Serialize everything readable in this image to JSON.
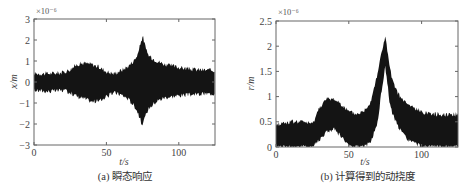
{
  "chart_data": [
    {
      "type": "area",
      "title": "",
      "caption": "(a) 瞬态响应",
      "xlabel": "t/s",
      "ylabel": "x/m",
      "y_multiplier": "×10⁻⁶",
      "xlim": [
        0,
        125
      ],
      "ylim": [
        -3,
        3
      ],
      "xticks": [
        0,
        50,
        100
      ],
      "yticks": [
        -3,
        -2,
        -1,
        0,
        1,
        2,
        3
      ],
      "grid": false,
      "description": "Dense oscillating transient response envelope (symmetric about zero)",
      "series": [
        {
          "name": "upper envelope",
          "x": [
            0,
            10,
            20,
            25,
            30,
            35,
            40,
            45,
            50,
            55,
            60,
            65,
            70,
            72,
            75,
            78,
            80,
            85,
            90,
            100,
            110,
            125
          ],
          "values": [
            0.4,
            0.4,
            0.45,
            0.6,
            0.85,
            0.9,
            0.85,
            0.7,
            0.5,
            0.4,
            0.55,
            0.75,
            1.1,
            1.4,
            2.2,
            1.4,
            1.2,
            1.0,
            0.85,
            0.7,
            0.6,
            0.55
          ]
        },
        {
          "name": "lower envelope",
          "x": [
            0,
            10,
            20,
            25,
            30,
            35,
            40,
            45,
            50,
            55,
            60,
            65,
            70,
            72,
            75,
            78,
            80,
            85,
            90,
            100,
            110,
            125
          ],
          "values": [
            -0.4,
            -0.45,
            -0.4,
            -0.5,
            -0.7,
            -0.8,
            -0.95,
            -0.9,
            -0.7,
            -0.5,
            -0.6,
            -0.8,
            -1.2,
            -1.5,
            -2.1,
            -1.4,
            -1.2,
            -0.9,
            -0.75,
            -0.65,
            -0.6,
            -0.55
          ]
        }
      ]
    },
    {
      "type": "area",
      "title": "",
      "caption": "(b) 计算得到的动挠度",
      "xlabel": "t/s",
      "ylabel": "r/m",
      "y_multiplier": "×10⁻⁶",
      "xlim": [
        0,
        125
      ],
      "ylim": [
        0,
        2.5
      ],
      "xticks": [
        0,
        50,
        100
      ],
      "yticks": [
        0,
        0.5,
        1,
        1.5,
        2,
        2.5
      ],
      "grid": false,
      "description": "Computed dynamic deflection band (noisy) with peak near t≈75s",
      "series": [
        {
          "name": "upper envelope",
          "x": [
            0,
            10,
            20,
            25,
            30,
            35,
            40,
            45,
            50,
            55,
            60,
            65,
            70,
            72,
            75,
            78,
            80,
            85,
            90,
            100,
            110,
            125
          ],
          "values": [
            0.45,
            0.5,
            0.5,
            0.45,
            0.8,
            0.95,
            0.95,
            0.85,
            0.7,
            0.65,
            0.7,
            0.9,
            1.5,
            1.8,
            2.2,
            1.6,
            1.3,
            1.0,
            0.85,
            0.7,
            0.65,
            0.65
          ]
        },
        {
          "name": "lower envelope",
          "x": [
            0,
            10,
            20,
            25,
            30,
            35,
            40,
            45,
            50,
            55,
            60,
            65,
            70,
            72,
            75,
            78,
            80,
            85,
            90,
            100,
            110,
            125
          ],
          "values": [
            0,
            0,
            0,
            0,
            0.15,
            0.3,
            0.35,
            0.2,
            0,
            0,
            0,
            0.1,
            0.5,
            1.0,
            1.6,
            0.9,
            0.65,
            0.35,
            0.15,
            0,
            0,
            0
          ]
        }
      ]
    }
  ]
}
